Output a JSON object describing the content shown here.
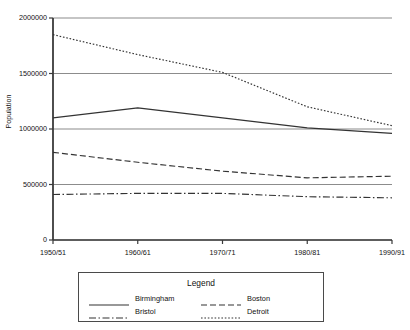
{
  "chart_data": {
    "type": "line",
    "title": "",
    "xlabel": "",
    "ylabel": "Population",
    "categories": [
      "1950/51",
      "1960/61",
      "1970/71",
      "1980/81",
      "1990/91"
    ],
    "yticks": [
      0,
      500000,
      1000000,
      1500000,
      2000000
    ],
    "ytick_labels": [
      "0",
      "500000",
      "1000000",
      "1500000",
      "2000000"
    ],
    "ylim": [
      0,
      2000000
    ],
    "grid": "horizontal",
    "legend_position": "below-plot",
    "legend_title": "Legend",
    "series": [
      {
        "name": "Birmingham",
        "style": "solid",
        "color": "#333333",
        "values": [
          1100000,
          1190000,
          1100000,
          1010000,
          960000
        ]
      },
      {
        "name": "Boston",
        "style": "dashed",
        "color": "#333333",
        "values": [
          790000,
          700000,
          620000,
          560000,
          575000
        ]
      },
      {
        "name": "Bristol",
        "style": "dashdot",
        "color": "#333333",
        "values": [
          410000,
          420000,
          420000,
          390000,
          380000
        ]
      },
      {
        "name": "Detroit",
        "style": "dotted",
        "color": "#333333",
        "values": [
          1850000,
          1670000,
          1510000,
          1200000,
          1030000
        ]
      }
    ]
  },
  "legend": {
    "title": "Legend",
    "entries": [
      {
        "label": "Birmingham",
        "style": "solid"
      },
      {
        "label": "Boston",
        "style": "dashed"
      },
      {
        "label": "Bristol",
        "style": "dashdot"
      },
      {
        "label": "Detroit",
        "style": "dotted"
      }
    ]
  },
  "axes": {
    "y_title": "Population"
  },
  "colors": {
    "line": "#333333",
    "gridline": "#8c8c8c",
    "axis": "#3a3a3a",
    "background": "#ffffff",
    "text": "#111111"
  }
}
